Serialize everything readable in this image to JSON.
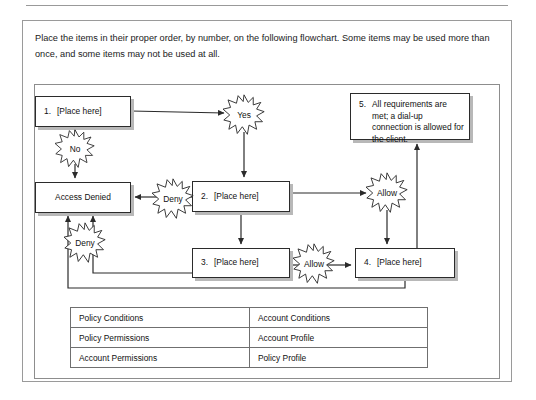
{
  "prompt": {
    "text": "Place the items in their proper order, by number, on the following flowchart. Some items may be used more than once, and some items may not be used at all."
  },
  "flowchart": {
    "type": "decision-flowchart",
    "nodes": [
      {
        "id": "n1",
        "number": "1.",
        "label": "[Place here]"
      },
      {
        "id": "n-denied",
        "number": "",
        "label": "Access Denied"
      },
      {
        "id": "n2",
        "number": "2.",
        "label": "[Place here]"
      },
      {
        "id": "n3",
        "number": "3.",
        "label": "[Place here]"
      },
      {
        "id": "n4",
        "number": "4.",
        "label": "[Place here]"
      },
      {
        "id": "n5",
        "number": "5.",
        "label": "All requirements are met; a dial-up connection is allowed for the client."
      }
    ],
    "edge_labels": {
      "yes": "Yes",
      "no": "No",
      "deny_from_2": "Deny",
      "deny_from_3": "Deny",
      "allow_from_2": "Allow",
      "allow_from_3": "Allow"
    }
  },
  "options_table": {
    "rows": [
      {
        "left": "Policy Conditions",
        "right": "Account Conditions"
      },
      {
        "left": "Policy Permissions",
        "right": "Account Profile"
      },
      {
        "left": "Account Permissions",
        "right": "Policy Profile"
      }
    ]
  },
  "colors": {
    "line": "#2b2b2b",
    "shadow": "#b8b8b8",
    "border": "#9a9a9a",
    "text": "#1a1a1a"
  }
}
